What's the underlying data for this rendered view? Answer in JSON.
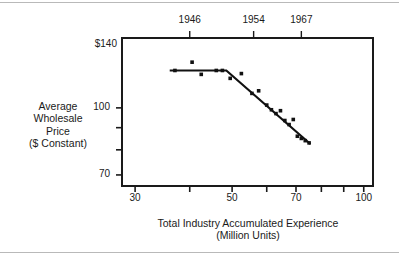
{
  "figure": {
    "y_axis_title_lines": [
      "Average",
      "Wholesale",
      "Price",
      "($ Constant)"
    ],
    "x_axis_title_lines": [
      "Total Industry Accumulated Experience",
      "(Million Units)"
    ]
  },
  "chart_data": {
    "type": "scatter",
    "title": "",
    "subtitle": "",
    "xlabel": "Total Industry Accumulated Experience (Million Units)",
    "ylabel": "Average Wholesale Price ($ Constant)",
    "xscale": "log",
    "yscale": "log",
    "xlim": [
      28,
      105
    ],
    "ylim": [
      66,
      145
    ],
    "grid": false,
    "legend": null,
    "x_ticks": [
      {
        "value": 30,
        "label": "30"
      },
      {
        "value": 40,
        "label": ""
      },
      {
        "value": 50,
        "label": "50"
      },
      {
        "value": 60,
        "label": ""
      },
      {
        "value": 70,
        "label": "70"
      },
      {
        "value": 80,
        "label": ""
      },
      {
        "value": 90,
        "label": ""
      },
      {
        "value": 100,
        "label": "100"
      }
    ],
    "y_ticks": [
      {
        "value": 140,
        "label": "$140"
      },
      {
        "value": 100,
        "label": "100"
      },
      {
        "value": 90,
        "label": ""
      },
      {
        "value": 80,
        "label": ""
      },
      {
        "value": 70,
        "label": "70"
      }
    ],
    "top_axis": {
      "name": "Year",
      "ticks": [
        {
          "label": "1946",
          "x_value": 40
        },
        {
          "label": "1954",
          "x_value": 56
        },
        {
          "label": "1967",
          "x_value": 72
        }
      ]
    },
    "series": [
      {
        "name": "Observed price points",
        "type": "scatter",
        "marker": "square",
        "color": "#111111",
        "points": [
          {
            "x": 37.0,
            "y": 122.0
          },
          {
            "x": 40.5,
            "y": 127.5
          },
          {
            "x": 42.5,
            "y": 119.5
          },
          {
            "x": 46.0,
            "y": 122.0
          },
          {
            "x": 47.5,
            "y": 122.0
          },
          {
            "x": 49.5,
            "y": 117.0
          },
          {
            "x": 52.5,
            "y": 120.0
          },
          {
            "x": 55.5,
            "y": 108.0
          },
          {
            "x": 57.5,
            "y": 109.5
          },
          {
            "x": 60.0,
            "y": 101.5
          },
          {
            "x": 61.5,
            "y": 99.0
          },
          {
            "x": 63.0,
            "y": 97.0
          },
          {
            "x": 64.5,
            "y": 98.5
          },
          {
            "x": 66.0,
            "y": 93.5
          },
          {
            "x": 67.5,
            "y": 91.5
          },
          {
            "x": 69.0,
            "y": 94.0
          },
          {
            "x": 70.5,
            "y": 86.0
          },
          {
            "x": 72.0,
            "y": 85.0
          },
          {
            "x": 73.5,
            "y": 84.0
          },
          {
            "x": 75.0,
            "y": 83.0
          }
        ]
      },
      {
        "name": "Fitted experience curve",
        "type": "line",
        "color": "#111111",
        "points": [
          {
            "x": 36.0,
            "y": 122.0
          },
          {
            "x": 48.5,
            "y": 122.0
          },
          {
            "x": 75.5,
            "y": 82.5
          }
        ]
      }
    ]
  }
}
